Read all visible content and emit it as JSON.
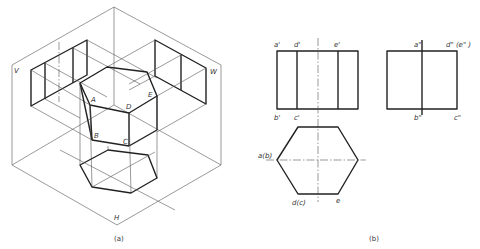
{
  "figure_a": {
    "caption": "(a)",
    "plane_labels": {
      "v": "V",
      "w": "W",
      "h": "H"
    },
    "vertex_labels": {
      "a": "A",
      "b": "B",
      "c": "C",
      "d": "D",
      "e": "E"
    }
  },
  "figure_b": {
    "caption": "(b)",
    "front_view": {
      "a": "a'",
      "d": "d'",
      "e": "e'",
      "b": "b'",
      "c": "c'"
    },
    "side_view": {
      "a": "a\"",
      "de": "d\" (e\" )",
      "b": "b\"",
      "c": "c\""
    },
    "top_view": {
      "ab": "a(b)",
      "dc": "d(c)",
      "e": "e"
    }
  },
  "colors": {
    "line": "#222222",
    "thin_line": "#555555",
    "background": "#ffffff"
  }
}
